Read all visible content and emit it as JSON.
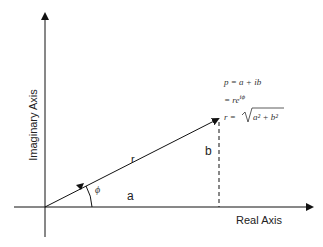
{
  "diagram": {
    "x_axis_label": "Real Axis",
    "y_axis_label": "Imaginary Axis",
    "vector_label": "r",
    "angle_label": "ϕ",
    "real_part_label": "a",
    "imag_part_label": "b",
    "equations": {
      "line1": "p = a + ib",
      "line2_prefix": "= re",
      "line2_sup": "iϕ",
      "line3_prefix": "r = ",
      "line3_radicand": "a² + b²"
    },
    "colors": {
      "stroke": "#111111",
      "text": "#222222"
    }
  }
}
